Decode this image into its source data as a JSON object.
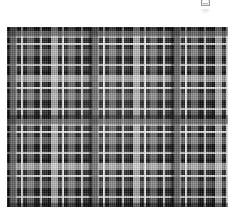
{
  "page": {
    "background_color": "#ffffff",
    "width": 238,
    "height": 220
  },
  "top_marker": {
    "icon": "clipped-square-icon",
    "description": "small partially cut-off square glyph at top right",
    "color": "#9a9a9a"
  },
  "swatch": {
    "title": "",
    "alt": "black and white tartan plaid fabric swatch",
    "x": 7,
    "y": 27,
    "width": 221,
    "height": 180,
    "palette": {
      "ground": "#2b2b2b",
      "black": "#0d0d0d",
      "dark_grey": "#3a3a3a",
      "mid_grey": "#7d7d7d",
      "light_grey": "#b8b8b8",
      "white": "#f2f2f2"
    },
    "sett": {
      "warp_repeat_px": 41,
      "weft_repeat_px": 44,
      "block_repeat_x_px": 82,
      "block_repeat_y_px": 88
    }
  }
}
